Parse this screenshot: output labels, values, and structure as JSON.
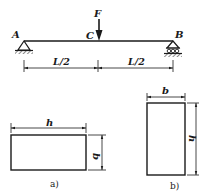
{
  "beam": {
    "point_labels": {
      "left_support": "A",
      "load_point": "C",
      "right_support": "B"
    },
    "load_label": "F",
    "span_labels": [
      "L/2",
      "L/2"
    ],
    "left_support_type": "pin",
    "right_support_type": "roller"
  },
  "sections": [
    {
      "caption": "a)",
      "width_label": "h",
      "height_label": "b",
      "orientation": "horizontal"
    },
    {
      "caption": "b)",
      "width_label": "b",
      "height_label": "h",
      "orientation": "vertical"
    }
  ],
  "colors": {
    "stroke": "#1a1a1a",
    "background": "#ffffff"
  }
}
